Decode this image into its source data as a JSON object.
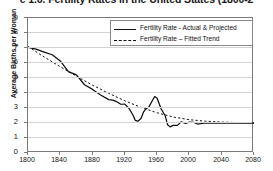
{
  "title": "e 1.6. Fertility Rates in the United States (1800-2",
  "axes": {
    "ylabel": "Average Births per Woman",
    "ylim": [
      0,
      9
    ],
    "yticks": [
      0,
      1,
      2,
      3,
      4,
      5,
      6,
      7,
      8,
      9
    ],
    "xlim": [
      1800,
      2080
    ],
    "xticks": [
      1800,
      1840,
      1880,
      1920,
      1960,
      2000,
      2040,
      2080
    ],
    "grid": "horizontal"
  },
  "legend": {
    "position": "top-center-right",
    "items": [
      {
        "label": "Fertility Rate - Actual & Projected",
        "style": "solid",
        "color": "#111111"
      },
      {
        "label": "Fertility Rate – Fitted Trend",
        "style": "dashed",
        "color": "#111111"
      }
    ]
  },
  "chart_data": {
    "type": "line",
    "title": "e 1.6. Fertility Rates in the United States (1800-2",
    "xlabel": "",
    "ylabel": "Average Births per Woman",
    "xlim": [
      1800,
      2080
    ],
    "ylim": [
      0,
      9
    ],
    "grid": "horizontal",
    "legend_position": "top-center-right",
    "series": [
      {
        "name": "Fertility Rate - Actual & Projected",
        "style": "solid",
        "color": "#111111",
        "x": [
          1800,
          1810,
          1820,
          1830,
          1840,
          1850,
          1860,
          1870,
          1880,
          1890,
          1900,
          1905,
          1910,
          1915,
          1920,
          1925,
          1930,
          1933,
          1936,
          1940,
          1943,
          1946,
          1950,
          1955,
          1957,
          1960,
          1965,
          1970,
          1973,
          1976,
          1980,
          1985,
          1990,
          1995,
          2000,
          2005,
          2010,
          2020,
          2040,
          2060,
          2080
        ],
        "y": [
          7.04,
          6.92,
          6.73,
          6.55,
          6.14,
          5.42,
          5.21,
          4.55,
          4.24,
          3.87,
          3.56,
          3.52,
          3.42,
          3.25,
          3.26,
          2.98,
          2.53,
          2.17,
          2.12,
          2.3,
          2.72,
          2.94,
          3.09,
          3.58,
          3.77,
          3.65,
          2.93,
          2.48,
          1.88,
          1.74,
          1.84,
          1.84,
          2.08,
          1.98,
          2.06,
          2.05,
          1.93,
          2.0,
          2.0,
          2.0,
          2.0
        ]
      },
      {
        "name": "Fertility Rate – Fitted Trend",
        "style": "dashed",
        "color": "#111111",
        "x": [
          1800,
          1820,
          1840,
          1860,
          1880,
          1900,
          1920,
          1940,
          1960,
          1980,
          2000,
          2020,
          2040,
          2060,
          2080
        ],
        "y": [
          7.1,
          6.4,
          5.75,
          5.12,
          4.52,
          3.98,
          3.48,
          3.04,
          2.68,
          2.4,
          2.22,
          2.12,
          2.06,
          2.03,
          2.01
        ]
      }
    ]
  }
}
